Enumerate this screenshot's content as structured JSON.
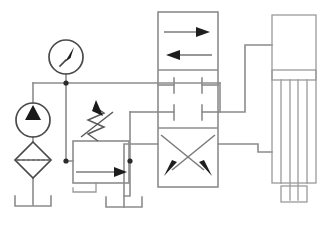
{
  "diagram": {
    "type": "hydraulic-schematic",
    "canvas": {
      "width": 332,
      "height": 227
    },
    "background_color": "#ffffff",
    "line_color": "#8c8c8c",
    "symbol_color": "#4a4a4a",
    "accent_color": "#1a1a1a"
  },
  "components": [
    {
      "id": "pressure-gauge",
      "name": "Pressure Gauge",
      "symbol": "circle-with-needle",
      "cx": 66,
      "cy": 57,
      "r": 17,
      "needle_angle_deg": -55
    },
    {
      "id": "hydraulic-pump",
      "name": "Hydraulic Pump",
      "symbol": "circle-with-solid-triangle",
      "cx": 33,
      "cy": 120,
      "r": 17,
      "flow_direction": "up"
    },
    {
      "id": "filter",
      "name": "Filter / Strainer",
      "symbol": "diamond-with-dashed-line",
      "cx": 33,
      "cy": 160,
      "half": 18
    },
    {
      "id": "reservoir-suction",
      "name": "Reservoir (Suction Tank)",
      "symbol": "open-tank-bracket",
      "cx": 33,
      "cy": 205,
      "width": 36
    },
    {
      "id": "relief-valve",
      "name": "Pressure Relief Valve",
      "symbol": "box-with-flow-arrow-and-adjustable-spring",
      "x": 73,
      "y": 141,
      "width": 56,
      "height": 42,
      "adjustable": true,
      "flow_arrow_direction": "right"
    },
    {
      "id": "directional-valve",
      "name": "4/3-Way Directional Control Valve",
      "symbol": "three-position-four-way-valve",
      "x": 158,
      "y": 12,
      "width": 60,
      "height": 175,
      "positions": [
        {
          "index": 0,
          "name": "Parallel Flow",
          "arrows": [
            "right",
            "left"
          ]
        },
        {
          "index": 1,
          "name": "Closed Center",
          "ports": [
            "blocked",
            "blocked",
            "blocked",
            "blocked"
          ]
        },
        {
          "index": 2,
          "name": "Crossed Flow",
          "arrows": [
            "down-left",
            "down-right"
          ]
        }
      ]
    },
    {
      "id": "reservoir-return",
      "name": "Reservoir (Return Tank)",
      "symbol": "open-tank-bracket",
      "cx": 124,
      "cy": 207,
      "width": 36
    },
    {
      "id": "cylinder",
      "name": "Double-Acting Cylinder",
      "symbol": "double-acting-cylinder-with-rod",
      "x": 272,
      "y": 15,
      "width": 44,
      "height": 168,
      "piston_y": 75,
      "rod_direction": "down"
    },
    {
      "id": "load-block",
      "name": "Load Block",
      "symbol": "rectangle",
      "x": 281,
      "y": 186,
      "width": 26,
      "height": 16
    }
  ],
  "junctions": [
    {
      "id": "junction-pressure-line",
      "x": 66,
      "y": 83
    },
    {
      "id": "junction-relief-inlet",
      "x": 66,
      "y": 161
    },
    {
      "id": "junction-relief-outlet",
      "x": 130,
      "y": 161
    }
  ],
  "connections": [
    {
      "from": "reservoir-suction",
      "to": "hydraulic-pump",
      "label": "suction-line"
    },
    {
      "from": "hydraulic-pump",
      "to": "filter",
      "label": "pump-to-filter"
    },
    {
      "from": "pressure-gauge",
      "to": "pressure-line",
      "label": "gauge-tap"
    },
    {
      "from": "pressure-line",
      "to": "relief-valve",
      "label": "relief-inlet"
    },
    {
      "from": "relief-valve",
      "to": "reservoir-return",
      "label": "relief-drain"
    },
    {
      "from": "pressure-line",
      "to": "directional-valve",
      "label": "pressure-port-P"
    },
    {
      "from": "directional-valve",
      "to": "reservoir-return",
      "label": "tank-port-T"
    },
    {
      "from": "directional-valve",
      "to": "cylinder",
      "label": "work-port-A"
    },
    {
      "from": "directional-valve",
      "to": "cylinder",
      "label": "work-port-B"
    }
  ]
}
